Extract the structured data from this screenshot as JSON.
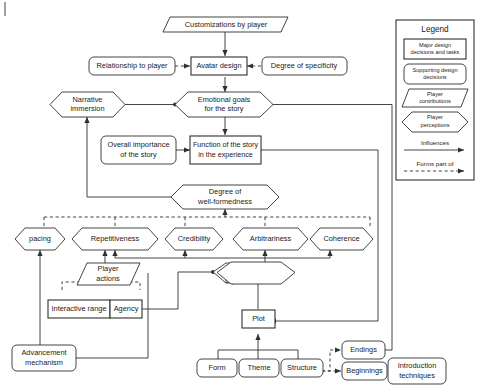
{
  "figure": {
    "type": "flow-diagram"
  },
  "nodes": {
    "customizations": "Customizations by player",
    "relationship": "Relationship to player",
    "avatar_design": "Avatar design",
    "degree_specificity": "Degree of specificity",
    "narrative_immersion_l1": "Narrative",
    "narrative_immersion_l2": "immersion",
    "emotional_goals_l1": "Emotional goals",
    "emotional_goals_l2": "for the story",
    "overall_importance_l1": "Overall importance",
    "overall_importance_l2": "of the story",
    "function_story_l1": "Function of the story",
    "function_story_l2": "in the experience",
    "degree_wellformed_l1": "Degree of",
    "degree_wellformed_l2": "well-formedness",
    "pacing": "pacing",
    "repetitiveness": "Repetitiveness",
    "credibility": "Credibility",
    "arbitrariness": "Arbitrariness",
    "coherence": "Coherence",
    "player_actions_l1": "Player",
    "player_actions_l2": "actions",
    "plotline_l1": "Plot line the",
    "plotline_l2": "player",
    "plotline_l3": "experiences",
    "interactive_range": "Interactive range",
    "agency": "Agency",
    "plot": "Plot",
    "advancement_l1": "Advancement",
    "advancement_l2": "mechanism",
    "form": "Form",
    "theme": "Theme",
    "structure": "Structure",
    "endings": "Endings",
    "beginnings": "Beginnings",
    "introduction_l1": "Introduction",
    "introduction_l2": "techniques"
  },
  "legend": {
    "title": "Legend",
    "items": {
      "major_l1": "Major design",
      "major_l2": "decisions and tasks",
      "supporting_l1": "Supporting design",
      "supporting_l2": "decisions",
      "contributions_l1": "Player",
      "contributions_l2": "contributions",
      "perceptions_l1": "Player",
      "perceptions_l2": "perceptions",
      "influences": "Influences",
      "forms_part_of": "Forms part of"
    }
  },
  "colors": {
    "stroke": "#303030",
    "text": "#1a1a1a",
    "background": "#ffffff",
    "margin_mark": "#7a7a7a"
  }
}
